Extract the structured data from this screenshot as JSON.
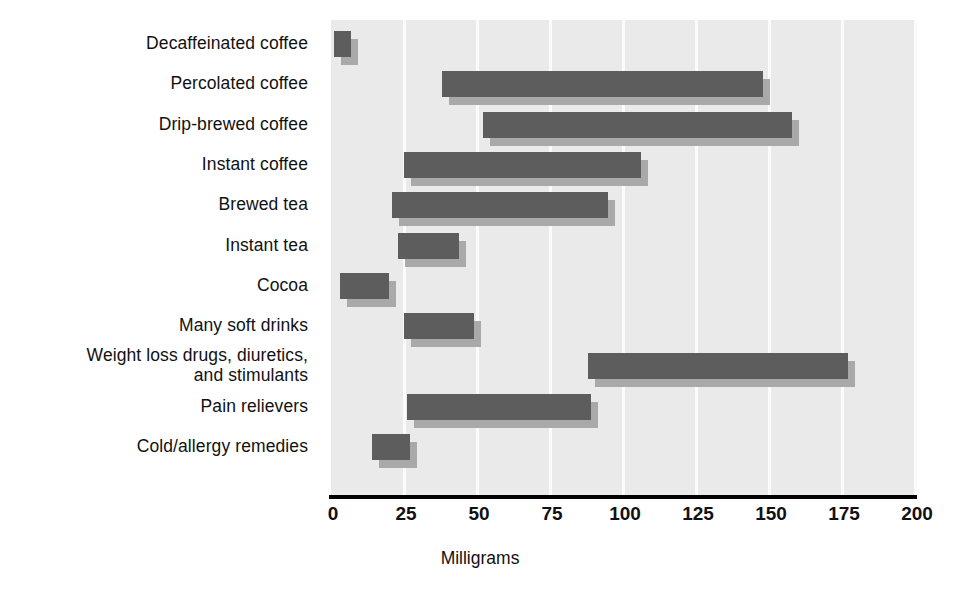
{
  "chart_data": {
    "type": "bar",
    "orientation": "horizontal",
    "range_bars": true,
    "title": "",
    "subtitle": "",
    "xlabel": "Milligrams",
    "ylabel": "",
    "xlim": [
      0,
      200
    ],
    "xticks": [
      0,
      25,
      50,
      75,
      100,
      125,
      150,
      175,
      200
    ],
    "xtick_labels": [
      "0",
      "25",
      "50",
      "75",
      "100",
      "125",
      "150",
      "175",
      "200"
    ],
    "grid": true,
    "grid_axis": "x",
    "legend": null,
    "legend_position": "none",
    "categories": [
      "Decaffeinated coffee",
      "Percolated coffee",
      "Drip-brewed coffee",
      "Instant coffee",
      "Brewed tea",
      "Instant tea",
      "Cocoa",
      "Many soft drinks",
      "Weight loss drugs, diuretics,\nand stimulants",
      "Pain relievers",
      "Cold/allergy remedies"
    ],
    "bars": [
      {
        "category": "Decaffeinated coffee",
        "low": 1,
        "high": 7
      },
      {
        "category": "Percolated coffee",
        "low": 38,
        "high": 148
      },
      {
        "category": "Drip-brewed coffee",
        "low": 52,
        "high": 158
      },
      {
        "category": "Instant coffee",
        "low": 25,
        "high": 106
      },
      {
        "category": "Brewed tea",
        "low": 21,
        "high": 95
      },
      {
        "category": "Instant tea",
        "low": 23,
        "high": 44
      },
      {
        "category": "Cocoa",
        "low": 3,
        "high": 20
      },
      {
        "category": "Many soft drinks",
        "low": 25,
        "high": 49
      },
      {
        "category": "Weight loss drugs, diuretics,\nand stimulants",
        "low": 88,
        "high": 177
      },
      {
        "category": "Pain relievers",
        "low": 26,
        "high": 89
      },
      {
        "category": "Cold/allergy remedies",
        "low": 14,
        "high": 27
      }
    ],
    "colors": {
      "bar": "#5d5d5d",
      "bar_shadow": "#a9a9a9",
      "plot_background": "#eaeaea",
      "gridline": "#fbfbfb",
      "axis": "#000000",
      "text": "#111111"
    }
  }
}
